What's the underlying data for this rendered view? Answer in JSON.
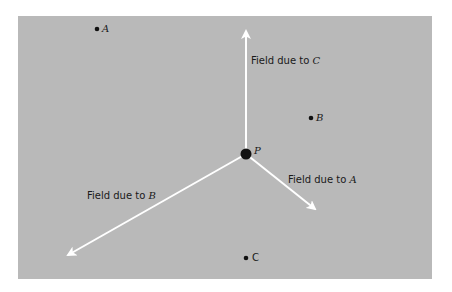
{
  "diagram": {
    "background_color": "#b9b9b9",
    "arrow_color": "#ffffff",
    "charge_color": "#111111",
    "point_P": {
      "label": "P",
      "x": 246,
      "y": 154
    },
    "charges": [
      {
        "label": "A",
        "x": 97,
        "y": 29
      },
      {
        "label": "B",
        "x": 311,
        "y": 118
      },
      {
        "label": "C",
        "x": 246,
        "y": 258
      }
    ],
    "fields": [
      {
        "text": "Field due to ",
        "source": "C",
        "tip_x": 246,
        "tip_y": 28
      },
      {
        "text": "Field due to ",
        "source": "A",
        "tip_x": 317,
        "tip_y": 211
      },
      {
        "text": "Field due to ",
        "source": "B",
        "tip_x": 65,
        "tip_y": 257
      }
    ]
  }
}
